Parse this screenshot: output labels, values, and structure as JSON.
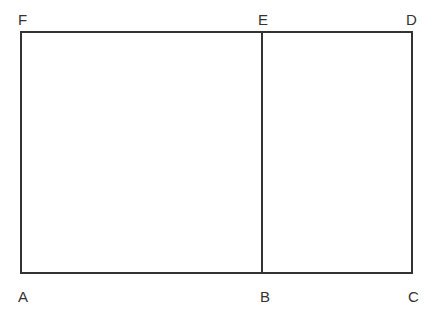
{
  "diagram": {
    "type": "geometric-figure",
    "colors": {
      "stroke": "#333333",
      "background": "#ffffff",
      "label": "#333333"
    },
    "points": {
      "A": {
        "label": "A",
        "x": 21,
        "y": 273
      },
      "B": {
        "label": "B",
        "x": 262,
        "y": 273
      },
      "C": {
        "label": "C",
        "x": 412,
        "y": 273
      },
      "D": {
        "label": "D",
        "x": 412,
        "y": 32
      },
      "E": {
        "label": "E",
        "x": 262,
        "y": 32
      },
      "F": {
        "label": "F",
        "x": 21,
        "y": 32
      }
    },
    "segments": [
      [
        "A",
        "B"
      ],
      [
        "B",
        "C"
      ],
      [
        "C",
        "D"
      ],
      [
        "D",
        "E"
      ],
      [
        "E",
        "F"
      ],
      [
        "F",
        "A"
      ],
      [
        "B",
        "E"
      ]
    ],
    "labels": {
      "F": "F",
      "E": "E",
      "D": "D",
      "A": "A",
      "B": "B",
      "C": "C"
    }
  }
}
